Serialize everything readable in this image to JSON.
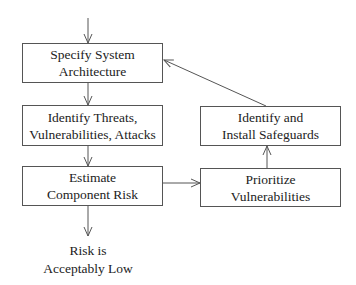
{
  "diagram": {
    "type": "flowchart",
    "nodes": [
      {
        "id": "specify",
        "lines": [
          "Specify System",
          "Architecture"
        ]
      },
      {
        "id": "identify_threats",
        "lines": [
          "Identify Threats,",
          "Vulnerabilities, Attacks"
        ]
      },
      {
        "id": "estimate",
        "lines": [
          "Estimate",
          "Component Risk"
        ]
      },
      {
        "id": "prioritize",
        "lines": [
          "Prioritize",
          "Vulnerabilities"
        ]
      },
      {
        "id": "safeguards",
        "lines": [
          "Identify and",
          "Install Safeguards"
        ]
      }
    ],
    "terminal": {
      "lines": [
        "Risk is",
        "Acceptably Low"
      ]
    },
    "edges": [
      {
        "from": "start",
        "to": "specify"
      },
      {
        "from": "specify",
        "to": "identify_threats"
      },
      {
        "from": "identify_threats",
        "to": "estimate"
      },
      {
        "from": "estimate",
        "to": "terminal"
      },
      {
        "from": "estimate",
        "to": "prioritize"
      },
      {
        "from": "prioritize",
        "to": "safeguards"
      },
      {
        "from": "safeguards",
        "to": "specify"
      }
    ],
    "colors": {
      "line": "#555555",
      "text": "#222222",
      "background": "#ffffff"
    }
  }
}
